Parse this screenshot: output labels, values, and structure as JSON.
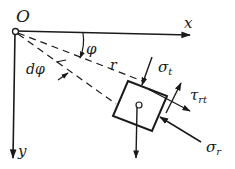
{
  "diagram": {
    "origin_label": "O",
    "x_axis_label": "x",
    "y_axis_label": "y",
    "angle_label": "φ",
    "dangle_label": "dφ",
    "radius_label": "r",
    "sigma_t_label": "σ",
    "sigma_t_sub": "t",
    "tau_label": "τ",
    "tau_sub": "rt",
    "sigma_r_label": "σ",
    "sigma_r_sub": "r",
    "ink_color": "#1a1a1a"
  }
}
